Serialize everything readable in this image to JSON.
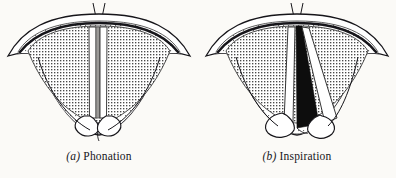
{
  "figure": {
    "background_color": "#fbfaf7",
    "ink_color": "#16151a",
    "glottis_open_color": "#0d0d0d",
    "vocal_fold_color": "#ffffff",
    "mucosa_tint_color": "#b9b8b6",
    "panels": [
      {
        "id": "phonation",
        "enumerator": "(a)",
        "label": "Phonation",
        "caption": "(a) Phonation",
        "state": "vocal folds adducted, glottis closed",
        "glottis": "closed slit",
        "arytenoids": "approximated"
      },
      {
        "id": "inspiration",
        "enumerator": "(b)",
        "label": "Inspiration",
        "caption": "(b) Inspiration",
        "state": "vocal folds abducted, glottis open",
        "glottis": "open triangle",
        "arytenoids": "separated"
      }
    ]
  }
}
